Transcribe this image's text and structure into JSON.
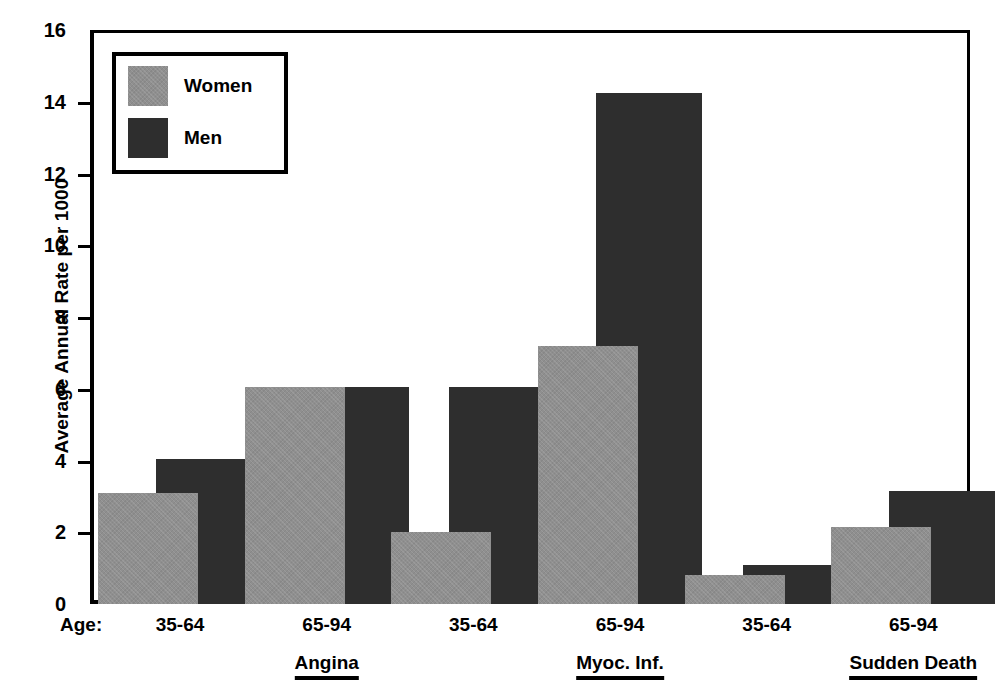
{
  "chart_data": {
    "type": "bar",
    "title": "",
    "xlabel": "Age:",
    "ylabel": "Average Annual Rate per 1000",
    "ylim": [
      0,
      16
    ],
    "yticks": [
      0,
      2,
      4,
      6,
      8,
      10,
      12,
      14,
      16
    ],
    "ytick_labels": [
      "0",
      "2",
      "4",
      "6",
      "8",
      "10",
      "12",
      "14",
      "16"
    ],
    "grid": false,
    "legend_position": "upper-left-inset",
    "categories": [
      "35-64",
      "65-94",
      "35-64",
      "65-94",
      "35-64",
      "65-94"
    ],
    "groups": [
      {
        "name": "Angina",
        "categories": [
          "35-64",
          "65-94"
        ]
      },
      {
        "name": "Myoc. Inf.",
        "categories": [
          "35-64",
          "65-94"
        ]
      },
      {
        "name": "Sudden Death",
        "categories": [
          "35-64",
          "65-94"
        ]
      }
    ],
    "series": [
      {
        "name": "Women",
        "color": "#8f8f8f",
        "values": [
          3.1,
          6.05,
          2.0,
          7.2,
          0.8,
          2.15
        ]
      },
      {
        "name": "Men",
        "color": "#2e2e2e",
        "values": [
          4.05,
          6.05,
          6.05,
          14.25,
          1.1,
          3.15
        ]
      }
    ]
  },
  "axis": {
    "y_title": "Average Annual Rate per 1000",
    "age_prefix": "Age:"
  },
  "legend": {
    "entries": [
      {
        "label": "Women",
        "color": "#8f8f8f"
      },
      {
        "label": "Men",
        "color": "#2e2e2e"
      }
    ]
  },
  "colors": {
    "women": "#8f8f8f",
    "men": "#2e2e2e",
    "axis": "#000000",
    "background": "#ffffff"
  }
}
